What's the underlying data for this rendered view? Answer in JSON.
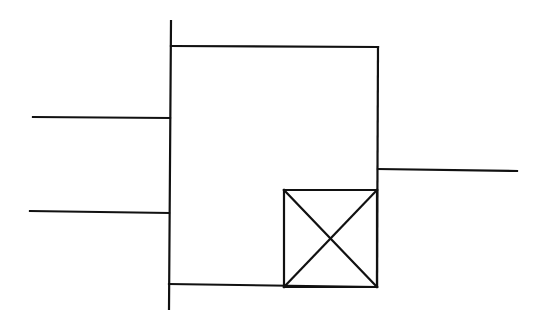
{
  "diagram": {
    "description": "Logic/block symbol: a rectangular block with a vertical input bar on the left, two input lines, one output line on the right, and a crossed square (X box) in the lower-right corner of the block.",
    "stroke_color": "#111111",
    "background_color": "#ffffff",
    "elements": {
      "input_bar": {
        "x1": 171,
        "y1": 21,
        "x2": 169,
        "y2": 309
      },
      "block_top": {
        "x1": 171,
        "y1": 46,
        "x2": 378,
        "y2": 47
      },
      "block_right": {
        "x1": 378,
        "y1": 47,
        "x2": 377,
        "y2": 287
      },
      "block_bottom": {
        "x1": 169,
        "y1": 284,
        "x2": 377,
        "y2": 287
      },
      "input_line_1": {
        "x1": 33,
        "y1": 117,
        "x2": 170,
        "y2": 118
      },
      "input_line_2": {
        "x1": 30,
        "y1": 211,
        "x2": 169,
        "y2": 213
      },
      "output_line": {
        "x1": 378,
        "y1": 169,
        "x2": 517,
        "y2": 171
      },
      "x_box": {
        "left": 284,
        "top": 190,
        "right": 377,
        "bottom": 287
      }
    },
    "labels": []
  }
}
